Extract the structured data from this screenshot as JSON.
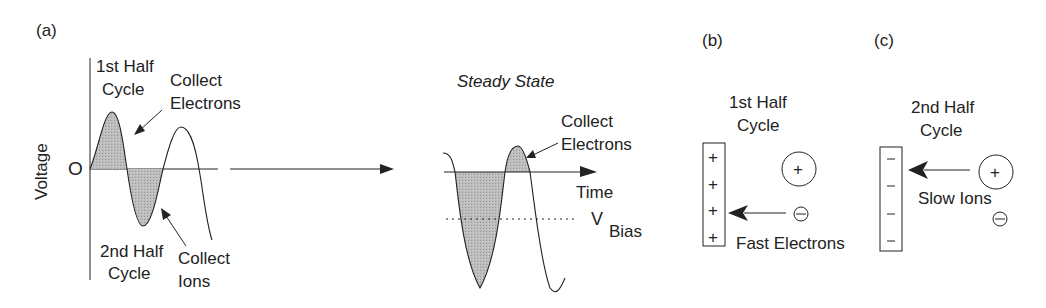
{
  "panels": {
    "a": {
      "label": "(a)",
      "y_axis_label": "Voltage",
      "origin_label": "O",
      "first_half": {
        "line1": "1st Half",
        "line2": "Cycle"
      },
      "collect_electrons": {
        "line1": "Collect",
        "line2": "Electrons"
      },
      "second_half": {
        "line1": "2nd Half",
        "line2": "Cycle"
      },
      "collect_ions": {
        "line1": "Collect",
        "line2": "Ions"
      },
      "steady_state": {
        "title": "Steady State",
        "collect_electrons": {
          "line1": "Collect",
          "line2": "Electrons"
        },
        "time_label": "Time",
        "vbias_main": "V",
        "vbias_sub": "Bias"
      }
    },
    "b": {
      "label": "(b)",
      "title": {
        "line1": "1st Half",
        "line2": "Cycle"
      },
      "plate_charges": [
        "+",
        "+",
        "+",
        "+"
      ],
      "ion_symbol": "+",
      "electron_symbol": "−",
      "caption": "Fast Electrons"
    },
    "c": {
      "label": "(c)",
      "title": {
        "line1": "2nd Half",
        "line2": "Cycle"
      },
      "plate_charges": [
        "−",
        "−",
        "−",
        "−"
      ],
      "ion_symbol": "+",
      "electron_symbol": "−",
      "caption": "Slow Ions"
    }
  },
  "colors": {
    "ink": "#222222",
    "fill": "#b8b8b8",
    "background": "#ffffff"
  }
}
